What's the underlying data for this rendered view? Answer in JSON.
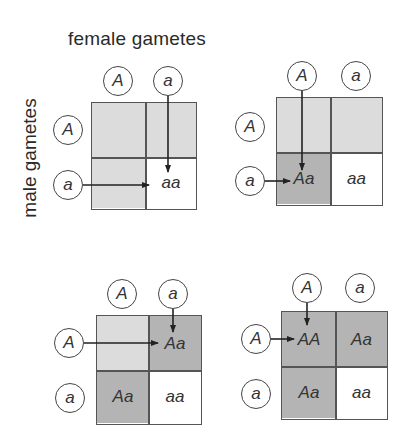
{
  "labels": {
    "female": "female gametes",
    "male": "male gametes"
  },
  "colors": {
    "light_shade": "#dcdcdc",
    "dark_shade": "#b4b4b4",
    "white": "#ffffff",
    "line": "#555555"
  },
  "squares": [
    {
      "id": "top-left",
      "female_gametes": [
        "A",
        "a"
      ],
      "male_gametes": [
        "A",
        "a"
      ],
      "cells": [
        {
          "row": 0,
          "col": 0,
          "text": "",
          "shade": "light"
        },
        {
          "row": 0,
          "col": 1,
          "text": "",
          "shade": "light"
        },
        {
          "row": 1,
          "col": 0,
          "text": "",
          "shade": "light"
        },
        {
          "row": 1,
          "col": 1,
          "text": "aa",
          "shade": "white"
        }
      ],
      "highlighted_cell": "aa"
    },
    {
      "id": "top-right",
      "female_gametes": [
        "A",
        "a"
      ],
      "male_gametes": [
        "A",
        "a"
      ],
      "cells": [
        {
          "row": 0,
          "col": 0,
          "text": "",
          "shade": "light"
        },
        {
          "row": 0,
          "col": 1,
          "text": "",
          "shade": "light"
        },
        {
          "row": 1,
          "col": 0,
          "text": "Aa",
          "shade": "dark"
        },
        {
          "row": 1,
          "col": 1,
          "text": "aa",
          "shade": "white"
        }
      ],
      "highlighted_cell": "Aa"
    },
    {
      "id": "bottom-left",
      "female_gametes": [
        "A",
        "a"
      ],
      "male_gametes": [
        "A",
        "a"
      ],
      "cells": [
        {
          "row": 0,
          "col": 0,
          "text": "",
          "shade": "light"
        },
        {
          "row": 0,
          "col": 1,
          "text": "Aa",
          "shade": "dark"
        },
        {
          "row": 1,
          "col": 0,
          "text": "Aa",
          "shade": "dark"
        },
        {
          "row": 1,
          "col": 1,
          "text": "aa",
          "shade": "white"
        }
      ],
      "highlighted_cell": "Aa"
    },
    {
      "id": "bottom-right",
      "female_gametes": [
        "A",
        "a"
      ],
      "male_gametes": [
        "A",
        "a"
      ],
      "cells": [
        {
          "row": 0,
          "col": 0,
          "text": "AA",
          "shade": "dark"
        },
        {
          "row": 0,
          "col": 1,
          "text": "Aa",
          "shade": "dark"
        },
        {
          "row": 1,
          "col": 0,
          "text": "Aa",
          "shade": "dark"
        },
        {
          "row": 1,
          "col": 1,
          "text": "aa",
          "shade": "white"
        }
      ],
      "highlighted_cell": "AA"
    }
  ]
}
